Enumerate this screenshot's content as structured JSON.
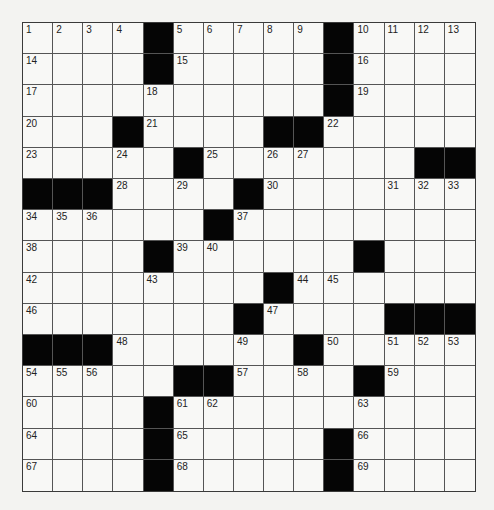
{
  "puzzle": {
    "rows": 15,
    "cols": 15,
    "colors": {
      "background": "#f3f3f1",
      "cell": "#f8f8f6",
      "block": "#050505",
      "gridline": "#555555"
    },
    "layout": [
      "....#.....#....",
      "....#.....#....",
      "..........#....",
      "...#....##.....",
      ".....#.......##",
      "###....#.......",
      "......#........",
      "....#......#...",
      "........#......",
      ".......#....###",
      "###......#.....",
      ".....##....#...",
      "....#..........",
      "....#.....#....",
      "....#.....#...."
    ],
    "numbers": [
      {
        "r": 0,
        "c": 0,
        "n": "1"
      },
      {
        "r": 0,
        "c": 1,
        "n": "2"
      },
      {
        "r": 0,
        "c": 2,
        "n": "3"
      },
      {
        "r": 0,
        "c": 3,
        "n": "4"
      },
      {
        "r": 0,
        "c": 5,
        "n": "5"
      },
      {
        "r": 0,
        "c": 6,
        "n": "6"
      },
      {
        "r": 0,
        "c": 7,
        "n": "7"
      },
      {
        "r": 0,
        "c": 8,
        "n": "8"
      },
      {
        "r": 0,
        "c": 9,
        "n": "9"
      },
      {
        "r": 0,
        "c": 11,
        "n": "10"
      },
      {
        "r": 0,
        "c": 12,
        "n": "11"
      },
      {
        "r": 0,
        "c": 13,
        "n": "12"
      },
      {
        "r": 0,
        "c": 14,
        "n": "13"
      },
      {
        "r": 1,
        "c": 0,
        "n": "14"
      },
      {
        "r": 1,
        "c": 5,
        "n": "15"
      },
      {
        "r": 1,
        "c": 11,
        "n": "16"
      },
      {
        "r": 2,
        "c": 0,
        "n": "17"
      },
      {
        "r": 2,
        "c": 4,
        "n": "18"
      },
      {
        "r": 2,
        "c": 11,
        "n": "19"
      },
      {
        "r": 3,
        "c": 0,
        "n": "20"
      },
      {
        "r": 3,
        "c": 4,
        "n": "21"
      },
      {
        "r": 3,
        "c": 10,
        "n": "22"
      },
      {
        "r": 4,
        "c": 0,
        "n": "23"
      },
      {
        "r": 4,
        "c": 3,
        "n": "24"
      },
      {
        "r": 4,
        "c": 6,
        "n": "25"
      },
      {
        "r": 4,
        "c": 8,
        "n": "26"
      },
      {
        "r": 4,
        "c": 9,
        "n": "27"
      },
      {
        "r": 5,
        "c": 3,
        "n": "28"
      },
      {
        "r": 5,
        "c": 5,
        "n": "29"
      },
      {
        "r": 5,
        "c": 8,
        "n": "30"
      },
      {
        "r": 5,
        "c": 12,
        "n": "31"
      },
      {
        "r": 5,
        "c": 13,
        "n": "32"
      },
      {
        "r": 5,
        "c": 14,
        "n": "33"
      },
      {
        "r": 6,
        "c": 0,
        "n": "34"
      },
      {
        "r": 6,
        "c": 1,
        "n": "35"
      },
      {
        "r": 6,
        "c": 2,
        "n": "36"
      },
      {
        "r": 6,
        "c": 7,
        "n": "37"
      },
      {
        "r": 7,
        "c": 0,
        "n": "38"
      },
      {
        "r": 7,
        "c": 5,
        "n": "39"
      },
      {
        "r": 7,
        "c": 6,
        "n": "40"
      },
      {
        "r": 7,
        "c": 11,
        "n": "41"
      },
      {
        "r": 8,
        "c": 0,
        "n": "42"
      },
      {
        "r": 8,
        "c": 4,
        "n": "43"
      },
      {
        "r": 8,
        "c": 9,
        "n": "44"
      },
      {
        "r": 8,
        "c": 10,
        "n": "45"
      },
      {
        "r": 9,
        "c": 0,
        "n": "46"
      },
      {
        "r": 9,
        "c": 8,
        "n": "47"
      },
      {
        "r": 10,
        "c": 3,
        "n": "48"
      },
      {
        "r": 10,
        "c": 7,
        "n": "49"
      },
      {
        "r": 10,
        "c": 10,
        "n": "50"
      },
      {
        "r": 10,
        "c": 12,
        "n": "51"
      },
      {
        "r": 10,
        "c": 13,
        "n": "52"
      },
      {
        "r": 10,
        "c": 14,
        "n": "53"
      },
      {
        "r": 11,
        "c": 0,
        "n": "54"
      },
      {
        "r": 11,
        "c": 1,
        "n": "55"
      },
      {
        "r": 11,
        "c": 2,
        "n": "56"
      },
      {
        "r": 11,
        "c": 7,
        "n": "57"
      },
      {
        "r": 11,
        "c": 9,
        "n": "58"
      },
      {
        "r": 11,
        "c": 12,
        "n": "59"
      },
      {
        "r": 12,
        "c": 0,
        "n": "60"
      },
      {
        "r": 12,
        "c": 5,
        "n": "61"
      },
      {
        "r": 12,
        "c": 6,
        "n": "62"
      },
      {
        "r": 12,
        "c": 11,
        "n": "63"
      },
      {
        "r": 13,
        "c": 0,
        "n": "64"
      },
      {
        "r": 13,
        "c": 5,
        "n": "65"
      },
      {
        "r": 13,
        "c": 11,
        "n": "66"
      },
      {
        "r": 14,
        "c": 0,
        "n": "67"
      },
      {
        "r": 14,
        "c": 5,
        "n": "68"
      },
      {
        "r": 14,
        "c": 11,
        "n": "69"
      }
    ],
    "entries": {}
  }
}
